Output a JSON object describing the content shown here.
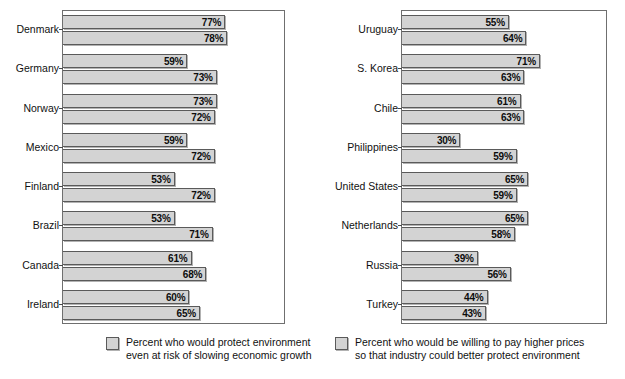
{
  "chart_data": {
    "type": "bar",
    "orientation": "horizontal",
    "title": "",
    "subtitle": "",
    "xlabel": "",
    "ylabel": "",
    "xlim": [
      0,
      100
    ],
    "unit": "%",
    "grid": false,
    "legend_position": "bottom",
    "panels": [
      {
        "id": "panel-left",
        "categories": [
          "Denmark",
          "Germany",
          "Norway",
          "Mexico",
          "Finland",
          "Brazil",
          "Canada",
          "Ireland"
        ],
        "series": [
          {
            "name": "Percent who would protect environment even at risk of slowing economic growth",
            "values": [
              77,
              59,
              73,
              59,
              53,
              53,
              61,
              60
            ],
            "labels": [
              "77%",
              "59%",
              "73%",
              "59%",
              "53%",
              "53%",
              "61%",
              "60%"
            ]
          },
          {
            "name": "Percent who would be willing to pay higher prices so that industry could better protect environment",
            "values": [
              78,
              73,
              72,
              72,
              72,
              71,
              68,
              65
            ],
            "labels": [
              "78%",
              "73%",
              "72%",
              "72%",
              "72%",
              "71%",
              "68%",
              "65%"
            ]
          }
        ]
      },
      {
        "id": "panel-right",
        "categories": [
          "Uruguay",
          "S. Korea",
          "Chile",
          "Philippines",
          "United States",
          "Netherlands",
          "Russia",
          "Turkey"
        ],
        "series": [
          {
            "name": "Percent who would protect environment even at risk of slowing economic growth",
            "values": [
              55,
              71,
              61,
              30,
              65,
              65,
              39,
              44
            ],
            "labels": [
              "55%",
              "71%",
              "61%",
              "30%",
              "65%",
              "65%",
              "39%",
              "44%"
            ]
          },
          {
            "name": "Percent who would be willing to pay higher prices so that industry could better protect environment",
            "values": [
              64,
              63,
              63,
              59,
              59,
              58,
              56,
              43
            ],
            "labels": [
              "64%",
              "63%",
              "63%",
              "59%",
              "59%",
              "58%",
              "56%",
              "43%"
            ]
          }
        ]
      }
    ],
    "legend": [
      {
        "swatch_color": "#d3d3d3",
        "line1": "Percent who would protect environment",
        "line2": "even at risk of slowing economic growth"
      },
      {
        "swatch_color": "#d3d3d3",
        "line1": "Percent who would be willing to pay higher prices",
        "line2": "so that industry could better protect environment"
      }
    ]
  },
  "colors": {
    "bar_fill": "#d3d3d3",
    "bar_stroke": "#5a5a5a",
    "plot_border": "#6f6f6f",
    "text": "#111111",
    "background": "#ffffff"
  }
}
